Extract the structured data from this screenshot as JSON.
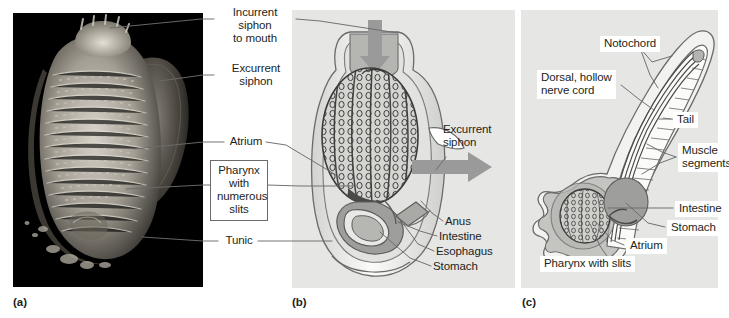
{
  "figure": {
    "background_color": "#ffffff",
    "panel_background_color": "#e6e6e4",
    "photo_background_color": "#000000",
    "line_color": "#6b6b6b",
    "arrow_color": "#9a9a9a",
    "tissue_gray": "#b8b8b6",
    "organ_gray": "#9e9e9c"
  },
  "panels": [
    {
      "id": "a",
      "caption": "(a)",
      "kind": "photograph"
    },
    {
      "id": "b",
      "caption": "(b)",
      "kind": "adult-diagram"
    },
    {
      "id": "c",
      "caption": "(c)",
      "kind": "larva-diagram"
    }
  ],
  "labels": {
    "incurrent_siphon": "Incurrent\nsiphon\nto mouth",
    "excurrent_siphon_a": "Excurrent\nsiphon",
    "atrium_a": "Atrium",
    "pharynx_boxed": "Pharynx\nwith\nnumerous\nslits",
    "tunic": "Tunic",
    "excurrent_siphon_b": "Excurrent\nsiphon",
    "anus": "Anus",
    "intestine_b": "Intestine",
    "esophagus": "Esophagus",
    "stomach_b": "Stomach",
    "notochord": "Notochord",
    "nerve_cord": "Dorsal, hollow\nnerve cord",
    "tail": "Tail",
    "muscle_segments": "Muscle\nsegments",
    "intestine_c": "Intestine",
    "stomach_c": "Stomach",
    "atrium_c": "Atrium",
    "pharynx_slits_c": "Pharynx with slits"
  }
}
